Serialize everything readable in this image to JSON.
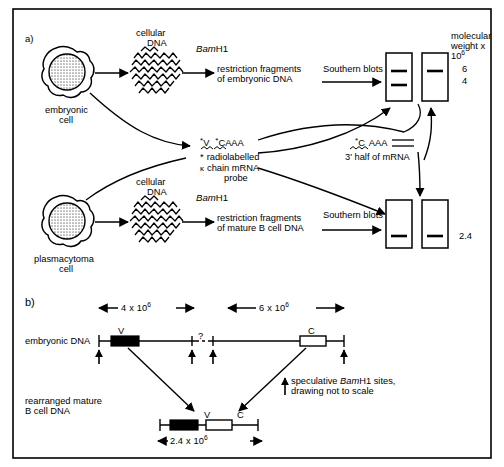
{
  "figure": {
    "background_color": "#ffffff",
    "ink_color": "#000000",
    "nucleus_fill": "#b3b3b3",
    "border": true
  },
  "panel_a": {
    "label": "a)",
    "rows": [
      {
        "cell_label_line1": "embryonic",
        "cell_label_line2": "cell",
        "dna_label_line1": "cellular",
        "dna_label_line2": "DNA",
        "enzyme_italic": "Bam",
        "enzyme_plain": "H1",
        "fragments_line1": "restriction fragments",
        "fragments_line2": "of embryonic DNA",
        "blot_arrow_label": "Southern blots",
        "blot_bands": [
          2,
          1
        ]
      },
      {
        "cell_label_line1": "plasmacytoma",
        "cell_label_line2": "cell",
        "dna_label_line1": "cellular",
        "dna_label_line2": "DNA",
        "enzyme_italic": "Bam",
        "enzyme_plain": "H1",
        "fragments_line1": "restriction fragments",
        "fragments_line2": "of mature B cell DNA",
        "blot_arrow_label": "Southern blots",
        "blot_bands": [
          1,
          1
        ]
      }
    ],
    "probe": {
      "seq_star1": "*",
      "seq_v": "V",
      "seq_star2": "*",
      "seq_c": "C",
      "seq_tail": "AAA",
      "legend_star": "*",
      "legend_line1": "radiolabelled",
      "legend_kappa": "κ",
      "legend_line2": "chain mRNA",
      "legend_line3": "probe"
    },
    "half_probe": {
      "star": "*",
      "c": "C",
      "tail": "AAA",
      "caption": "3' half of mRNA"
    },
    "mw_axis": {
      "line1": "molecular",
      "line2": "weight x",
      "line3_base": "10",
      "line3_exp": "6",
      "values": [
        "6",
        "4"
      ]
    },
    "mw_lower_value": "2.4"
  },
  "panel_b": {
    "label": "b)",
    "embryonic_label_line1": "embryonic DNA",
    "rearranged_label_line1": "rearranged mature",
    "rearranged_label_line2": "B cell DNA",
    "scale_bars": [
      {
        "value": "4",
        "times": "x",
        "base": "10",
        "exp": "6"
      },
      {
        "value": "6",
        "times": "x",
        "base": "10",
        "exp": "6"
      }
    ],
    "bottom_scale": {
      "value": "2.4",
      "times": "x",
      "base": "10",
      "exp": "6"
    },
    "gene_v": "V",
    "gene_c": "C",
    "unknown_marker": "?",
    "legend_line1_a": "speculative ",
    "legend_line1_italic": "Bam",
    "legend_line1_b": "H1 sites,",
    "legend_line2": "drawing not to scale"
  }
}
